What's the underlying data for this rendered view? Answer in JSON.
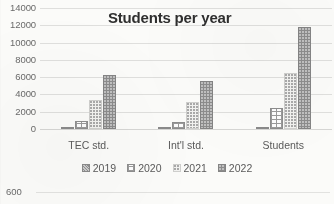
{
  "chart_data": {
    "type": "bar",
    "title": "Students per year",
    "xlabel": "",
    "ylabel": "",
    "ylim": [
      0,
      14000
    ],
    "ytick_step": 2000,
    "yticks": [
      "14000",
      "12000",
      "10000",
      "8000",
      "6000",
      "4000",
      "2000",
      "0"
    ],
    "grid": true,
    "legend_position": "bottom",
    "categories": [
      "TEC std.",
      "Int'l std.",
      "Students"
    ],
    "series": [
      {
        "name": "2019",
        "values": [
          120,
          110,
          260
        ],
        "color": "#8f8f8f",
        "pattern": "diagonal-hatch"
      },
      {
        "name": "2020",
        "values": [
          880,
          760,
          2400
        ],
        "color": "#fdfdfd",
        "pattern": "grid-crosshatch"
      },
      {
        "name": "2021",
        "values": [
          3350,
          3120,
          6520
        ],
        "color": "#f2f2f0",
        "pattern": "light-dots"
      },
      {
        "name": "2022",
        "values": [
          6300,
          5500,
          11800
        ],
        "color": "#8c8c8c",
        "pattern": "dark-dots"
      }
    ]
  },
  "next_chart": {
    "ytick": "600"
  }
}
